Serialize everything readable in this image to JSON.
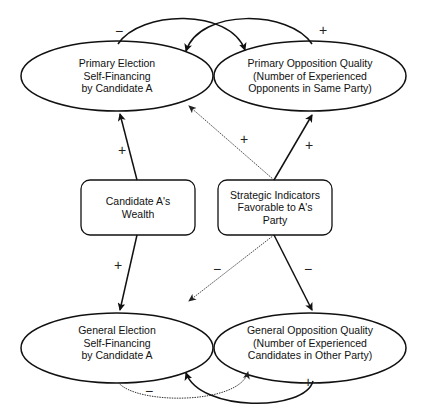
{
  "diagram": {
    "nodes": {
      "primary_self_financing": {
        "shape": "ellipse",
        "lines": [
          "Primary Election",
          "Self-Financing",
          "by Candidate A"
        ]
      },
      "primary_opposition_quality": {
        "shape": "ellipse",
        "lines": [
          "Primary Opposition Quality",
          "(Number of Experienced",
          "Opponents in Same Party)"
        ]
      },
      "candidate_wealth": {
        "shape": "rounded-rectangle",
        "lines": [
          "Candidate A's",
          "Wealth"
        ]
      },
      "strategic_indicators": {
        "shape": "rounded-rectangle",
        "lines": [
          "Strategic Indicators",
          "Favorable to A's",
          "Party"
        ]
      },
      "general_self_financing": {
        "shape": "ellipse",
        "lines": [
          "General Election",
          "Self-Financing",
          "by Candidate A"
        ]
      },
      "general_opposition_quality": {
        "shape": "ellipse",
        "lines": [
          "General Opposition Quality",
          "(Number of Experienced",
          "Candidates in Other Party)"
        ]
      }
    },
    "edges": [
      {
        "from": "primary_self_financing",
        "to": "primary_opposition_quality",
        "sign": "−",
        "style": "solid-curved"
      },
      {
        "from": "primary_opposition_quality",
        "to": "primary_self_financing",
        "sign": "+",
        "style": "solid-curved"
      },
      {
        "from": "candidate_wealth",
        "to": "primary_self_financing",
        "sign": "+",
        "style": "solid"
      },
      {
        "from": "strategic_indicators",
        "to": "primary_self_financing",
        "sign": "+",
        "style": "dotted"
      },
      {
        "from": "strategic_indicators",
        "to": "primary_opposition_quality",
        "sign": "+",
        "style": "solid"
      },
      {
        "from": "candidate_wealth",
        "to": "general_self_financing",
        "sign": "+",
        "style": "solid"
      },
      {
        "from": "strategic_indicators",
        "to": "general_self_financing",
        "sign": "−",
        "style": "dotted"
      },
      {
        "from": "strategic_indicators",
        "to": "general_opposition_quality",
        "sign": "−",
        "style": "solid"
      },
      {
        "from": "general_self_financing",
        "to": "general_opposition_quality",
        "sign": "−",
        "style": "dotted-curved"
      },
      {
        "from": "general_opposition_quality",
        "to": "general_self_financing",
        "sign": "+",
        "style": "solid-curved"
      }
    ],
    "signs": {
      "top_loop_minus": "−",
      "top_loop_plus": "+",
      "wealth_to_primary": "+",
      "strategic_to_primary_self": "+",
      "strategic_to_primary_opp": "+",
      "wealth_to_general": "+",
      "strategic_to_general_self": "−",
      "strategic_to_general_opp": "−",
      "bottom_loop_minus": "−",
      "bottom_loop_plus": "+"
    },
    "colors": {
      "stroke": "#111111",
      "background": "#ffffff"
    }
  }
}
